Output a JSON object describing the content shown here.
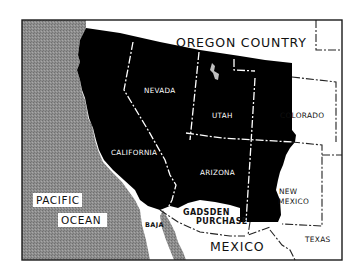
{
  "map": {
    "title": "",
    "colors": {
      "background": "#ffffff",
      "frame": "#1a1a1a",
      "ceded_territory": "#000000",
      "ocean": "#8a8a8a",
      "land_outside": "#ffffff",
      "boundary_lines": "#ffffff",
      "dashed_boundaries_outside": "#222222"
    },
    "regions": {
      "oregon_country": "OREGON COUNTRY",
      "nevada": "NEVADA",
      "utah": "UTAH",
      "colorado": "COLORADO",
      "california": "CALIFORNIA",
      "arizona": "ARIZONA",
      "new_mexico_line1": "NEW",
      "new_mexico_line2": "MEXICO",
      "gadsden_line1": "GADSDEN",
      "gadsden_line2": "PURCHASE",
      "baja": "BAJA",
      "mexico": "MEXICO",
      "texas": "TEXAS",
      "pacific_line1": "PACIFIC",
      "pacific_line2": "OCEAN"
    }
  }
}
